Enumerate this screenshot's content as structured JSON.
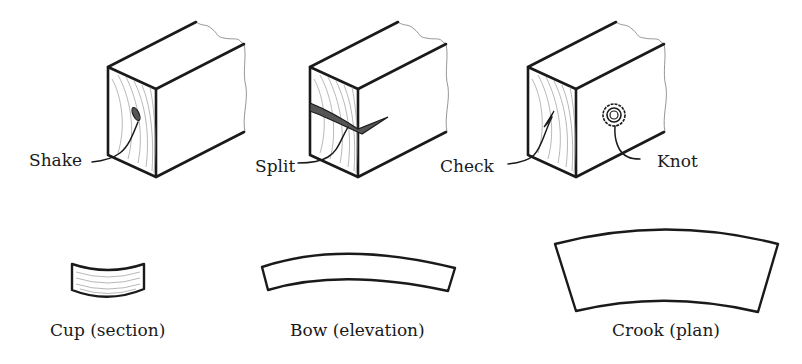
{
  "figure": {
    "colors": {
      "ink": "#1a1a1a",
      "grain": "#9a9a9a",
      "background": "#ffffff"
    },
    "top_row": [
      {
        "id": "shake",
        "label": "Shake"
      },
      {
        "id": "split",
        "label": "Split"
      },
      {
        "id": "check",
        "label": "Check"
      },
      {
        "id": "knot",
        "label": "Knot"
      }
    ],
    "bottom_row": [
      {
        "id": "cup",
        "label": "Cup (section)"
      },
      {
        "id": "bow",
        "label": "Bow (elevation)"
      },
      {
        "id": "crook",
        "label": "Crook (plan)"
      }
    ]
  }
}
